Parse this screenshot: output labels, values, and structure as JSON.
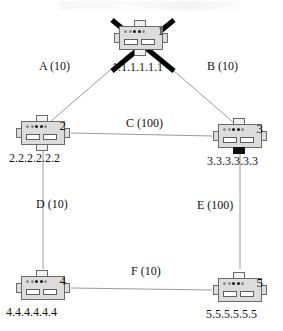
{
  "diagram": {
    "type": "network-topology",
    "nodes": [
      {
        "id": "1",
        "number": "1",
        "ip": "1.1.1.1.1.1",
        "status": "failed",
        "x": 141,
        "y": 38
      },
      {
        "id": "2",
        "number": "2",
        "ip": "2.2.2.2.2.2",
        "status": "up",
        "x": 43,
        "y": 133
      },
      {
        "id": "3",
        "number": "3",
        "ip": "3.3.3.3.3.3",
        "status": "up",
        "x": 240,
        "y": 133
      },
      {
        "id": "4",
        "number": "4",
        "ip": "4.4.4.4.4.4",
        "status": "up",
        "x": 43,
        "y": 283
      },
      {
        "id": "5",
        "number": "5",
        "ip": "5.5.5.5.5.5",
        "status": "up",
        "x": 240,
        "y": 283
      }
    ],
    "links": [
      {
        "name": "A",
        "cost": "10",
        "label": "A (10)",
        "from": "1",
        "to": "2"
      },
      {
        "name": "B",
        "cost": "10",
        "label": "B (10)",
        "from": "1",
        "to": "3"
      },
      {
        "name": "C",
        "cost": "100",
        "label": "C (100)",
        "from": "2",
        "to": "3"
      },
      {
        "name": "D",
        "cost": "10",
        "label": "D (10)",
        "from": "2",
        "to": "4"
      },
      {
        "name": "E",
        "cost": "100",
        "label": "E (100)",
        "from": "3",
        "to": "5"
      },
      {
        "name": "F",
        "cost": "10",
        "label": "F (10)",
        "from": "4",
        "to": "5"
      }
    ],
    "failure_marker": {
      "name": "node-1-failure-cross",
      "target_node": "1"
    },
    "colors": {
      "line": "#9a9a9a",
      "text": "#111111",
      "device_fill": "#dcdcdc",
      "device_stroke": "#6a6a6a",
      "cross": "#000000"
    }
  }
}
